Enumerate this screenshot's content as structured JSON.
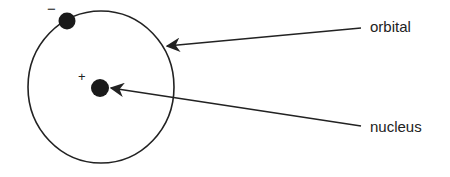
{
  "diagram": {
    "labels": {
      "orbital": "orbital",
      "nucleus": "nucleus"
    },
    "charges": {
      "electron": "−",
      "nucleus": "+"
    },
    "colors": {
      "stroke": "#222222",
      "background": "#ffffff"
    }
  }
}
